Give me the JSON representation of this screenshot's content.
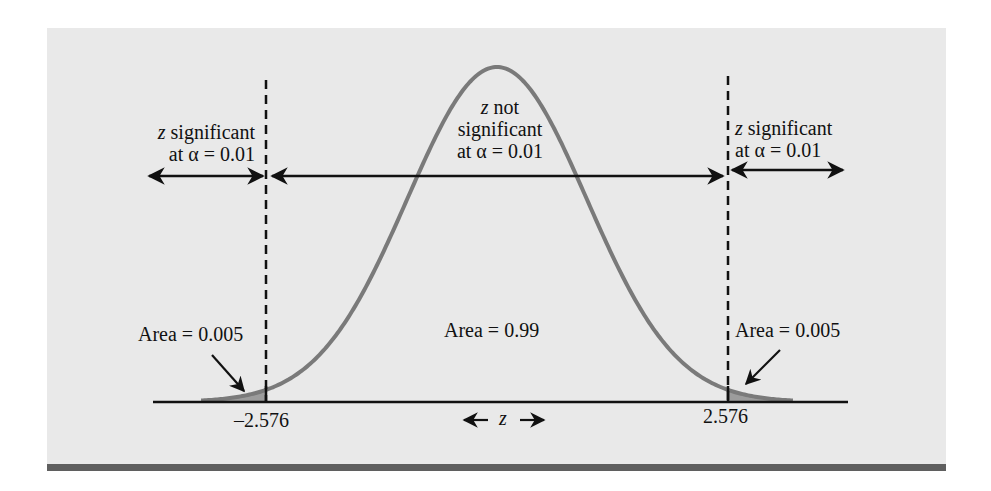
{
  "figure": {
    "panel_color": "#e9e9e9",
    "bar_color": "#5f5f5f",
    "curve_color": "#7a7a7a",
    "shade_color": "#9c9c9c",
    "axis_variable": "z"
  },
  "regions": {
    "left": {
      "var": "z",
      "line1": " significant",
      "line2": "at α = 0.01"
    },
    "center": {
      "var": "z",
      "line1": " not",
      "line2": "significant",
      "line3": "at α = 0.01"
    },
    "right": {
      "var": "z",
      "line1": " significant",
      "line2": "at α = 0.01"
    }
  },
  "areas": {
    "left": "Area = 0.005",
    "center": "Area = 0.99",
    "right": "Area = 0.005"
  },
  "critical_values": {
    "left": "–2.576",
    "right": "2.576"
  },
  "axis": {
    "left_arrow": "←",
    "label": "z",
    "right_arrow": "→"
  },
  "chart_data": {
    "type": "area",
    "xlabel": "z",
    "ylabel": "",
    "distribution": "standard normal",
    "critical_values": [
      -2.576,
      2.576
    ],
    "regions": [
      {
        "name": "z significant at α = 0.01",
        "range": [
          "-inf",
          -2.576
        ],
        "area": 0.005
      },
      {
        "name": "z not significant at α = 0.01",
        "range": [
          -2.576,
          2.576
        ],
        "area": 0.99
      },
      {
        "name": "z significant at α = 0.01",
        "range": [
          2.576,
          "inf"
        ],
        "area": 0.005
      }
    ],
    "tick_labels": [
      "–2.576",
      "2.576"
    ],
    "grid": false,
    "legend": null
  }
}
